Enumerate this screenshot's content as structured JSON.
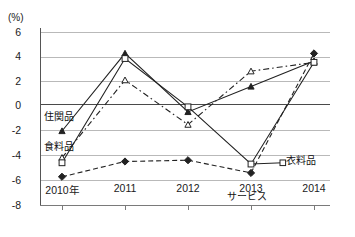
{
  "chart_data": {
    "type": "line",
    "title": "",
    "unit_label": "(%)",
    "xlabel": "",
    "ylabel": "",
    "categories": [
      "2010年",
      "2011",
      "2012",
      "2013",
      "2014"
    ],
    "x_tick_labels": [
      "2010年",
      "2011",
      "2012",
      "2013",
      "2014"
    ],
    "y_tick_labels": [
      "6",
      "4",
      "2",
      "0",
      "-2",
      "-4",
      "-6",
      "-8"
    ],
    "y_tick_values": [
      6,
      4,
      2,
      0,
      -2,
      -4,
      -6,
      -8
    ],
    "ylim": [
      -8,
      6
    ],
    "grid": true,
    "legend_position": "inline-annotations",
    "series": [
      {
        "name": "住関品",
        "marker": "filled-triangle",
        "line_style": "solid",
        "color": "#222222",
        "values": [
          -2.1,
          4.0,
          -0.6,
          1.4,
          3.4
        ],
        "label_position": "left-inline"
      },
      {
        "name": "食料品",
        "marker": "open-triangle",
        "line_style": "dash-dot",
        "color": "#222222",
        "values": [
          -4.2,
          1.9,
          -1.6,
          2.6,
          3.3
        ],
        "label_position": "left-inline"
      },
      {
        "name": "衣料品",
        "marker": "open-square",
        "line_style": "solid",
        "color": "#222222",
        "values": [
          -4.6,
          3.6,
          -0.2,
          -4.7,
          3.3
        ],
        "label_position": "right-end"
      },
      {
        "name": "サービス",
        "marker": "filled-diamond",
        "line_style": "dashed",
        "color": "#222222",
        "values": [
          -5.7,
          -4.5,
          -4.4,
          -5.4,
          4.0
        ],
        "label_position": "below-2013"
      }
    ],
    "annotations": [
      {
        "text": "住関品",
        "near": "2010 / -1.0"
      },
      {
        "text": "食料品",
        "near": "2010 / -3.2"
      },
      {
        "text": "衣料品",
        "near": "2014 / -4.6"
      },
      {
        "text": "サービス",
        "near": "2013 / -6.3"
      }
    ]
  }
}
